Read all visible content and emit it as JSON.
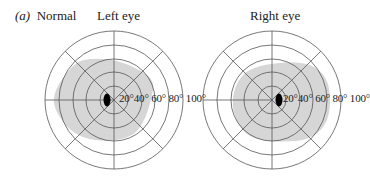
{
  "figure": {
    "panel_letter": "(a)",
    "panel_title": "Normal",
    "colors": {
      "field_fill": "#d6d6d6",
      "grid_line": "#555555",
      "blind_spot": "#000000",
      "background": "#ffffff"
    },
    "ring_labels": [
      "20°",
      "40°",
      "60°",
      "80°",
      "100°"
    ],
    "ring_labels_text": "20°40° 60° 80° 100°",
    "charts": [
      {
        "title": "Left eye",
        "center": [
          114,
          100
        ],
        "ring_radii": [
          14,
          28,
          41,
          55,
          69
        ],
        "blind_spot": {
          "cx": 107,
          "cy": 100,
          "rx": 3.5,
          "ry": 6.5
        },
        "field_shape": "temporal extension to the left"
      },
      {
        "title": "Right eye",
        "center": [
          272,
          100
        ],
        "ring_radii": [
          14,
          28,
          41,
          55,
          69
        ],
        "blind_spot": {
          "cx": 279,
          "cy": 100,
          "rx": 3.5,
          "ry": 6.5
        },
        "field_shape": "temporal extension to the right"
      }
    ]
  }
}
